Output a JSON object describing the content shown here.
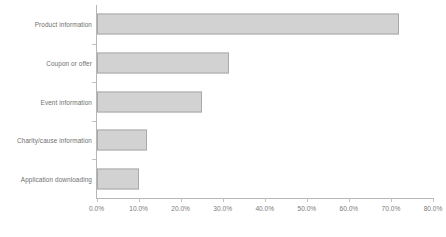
{
  "chart_data": {
    "type": "bar",
    "orientation": "horizontal",
    "title": "",
    "subtitle": "",
    "xlabel": "",
    "ylabel": "",
    "categories": [
      "Product information",
      "Coupon or offer",
      "Event information",
      "Charity/cause information",
      "Application downloading"
    ],
    "values": [
      72.0,
      31.4,
      25.0,
      12.1,
      10.2
    ],
    "xlim": [
      0,
      80
    ],
    "xticks": [
      0,
      10,
      20,
      30,
      40,
      50,
      60,
      70,
      80
    ],
    "xtick_labels": [
      "0.0%",
      "10.0%",
      "20.0%",
      "30.0%",
      "40.0%",
      "50.0%",
      "60.0%",
      "70.0%",
      "80.0%"
    ],
    "grid": false,
    "legend": null,
    "bar_fill_color": "#d2d2d2",
    "bar_border_color": "#a9a9a9",
    "axis_color": "#b6b6b6",
    "label_color": "#6f6f6f",
    "background_color": "#ffffff"
  }
}
